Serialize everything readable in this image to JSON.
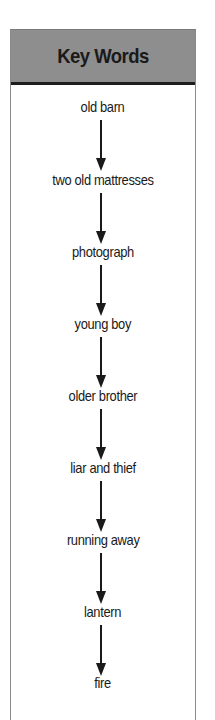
{
  "header": {
    "title": "Key Words"
  },
  "keywords": [
    {
      "label": "old barn"
    },
    {
      "label": "two old mattresses"
    },
    {
      "label": "photograph"
    },
    {
      "label": "young boy"
    },
    {
      "label": "older brother"
    },
    {
      "label": "liar and thief"
    },
    {
      "label": "running away"
    },
    {
      "label": "lantern"
    },
    {
      "label": "fire"
    }
  ],
  "colors": {
    "header_bg": "#8e8e8e",
    "header_border": "#1e1e1e",
    "text": "#1a1a1a",
    "panel_border": "#8a8a8a"
  }
}
